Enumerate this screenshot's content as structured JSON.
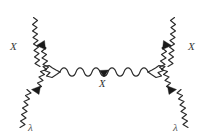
{
  "diagram": {
    "type": "tree-level-scattering",
    "background_color": "#ffffff",
    "line_color": "#2b2b2b",
    "arrow_color": "#1a1a1a",
    "labels": {
      "upper_left": "X",
      "upper_right": "X",
      "lower_left": "λ",
      "lower_right": "λ",
      "internal": "X"
    },
    "legs": [
      {
        "name": "upper-left-leg",
        "label": "X",
        "from": [
          33,
          17
        ],
        "to": [
          60,
          72
        ],
        "arrow_direction": "toward-vertex"
      },
      {
        "name": "upper-right-leg",
        "label": "X",
        "from": [
          176,
          17
        ],
        "to": [
          148,
          72
        ],
        "arrow_direction": "toward-vertex"
      },
      {
        "name": "lower-left-leg",
        "label": "λ",
        "from": [
          20,
          128
        ],
        "to": [
          60,
          72
        ],
        "arrow_direction": "toward-vertex"
      },
      {
        "name": "lower-right-leg",
        "label": "λ",
        "from": [
          188,
          128
        ],
        "to": [
          148,
          72
        ],
        "arrow_direction": "toward-vertex"
      }
    ],
    "internal_line": {
      "name": "internal-propagator",
      "label": "X",
      "from": [
        60,
        72
      ],
      "to": [
        148,
        72
      ],
      "arrow_direction": "right-to-left"
    },
    "vertices": [
      {
        "name": "left-vertex",
        "x": 60,
        "y": 72
      },
      {
        "name": "right-vertex",
        "x": 148,
        "y": 72
      }
    ]
  }
}
